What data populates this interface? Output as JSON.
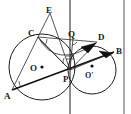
{
  "figure": {
    "width": 131,
    "height": 114,
    "background_color": "#ffffff",
    "ink_color": "#1c1c1c"
  },
  "labels": {
    "A": "A",
    "B": "B",
    "C": "C",
    "D": "D",
    "E": "E",
    "P": "P",
    "Q": "Q",
    "O": "O",
    "O_prime": "O'"
  },
  "points": [
    {
      "id": "A",
      "label": "A",
      "x": 12,
      "y": 90,
      "label_x": 6,
      "label_y": 98
    },
    {
      "id": "B",
      "label": "B",
      "x": 114,
      "y": 52,
      "label_x": 116,
      "label_y": 51
    },
    {
      "id": "C",
      "label": "C",
      "x": 38,
      "y": 37,
      "label_x": 30,
      "label_y": 35
    },
    {
      "id": "D",
      "label": "D",
      "x": 97,
      "y": 42,
      "label_x": 99,
      "label_y": 39
    },
    {
      "id": "E",
      "label": "E",
      "x": 50,
      "y": 13,
      "label_x": 46,
      "label_y": 11
    },
    {
      "id": "P",
      "label": "P",
      "x": 70,
      "y": 70,
      "label_x": 64,
      "label_y": 80
    },
    {
      "id": "Q",
      "label": "Q",
      "x": 73,
      "y": 38,
      "label_x": 70,
      "label_y": 36
    },
    {
      "id": "O",
      "label": "O",
      "x": 42,
      "y": 67,
      "label_x": 31,
      "label_y": 71
    },
    {
      "id": "Oprime",
      "label": "O'",
      "x": 92,
      "y": 70,
      "label_x": 86,
      "label_y": 78
    }
  ],
  "circles": [
    {
      "id": "circle-O",
      "center_label": "O",
      "cx": 42,
      "cy": 67,
      "r": 33
    },
    {
      "id": "circle-Oprime",
      "center_label": "O'",
      "cx": 92,
      "cy": 70,
      "r": 24
    }
  ],
  "segments": [
    {
      "id": "seg-AB",
      "from": "A",
      "to": "B"
    },
    {
      "id": "seg-AC",
      "from": "A",
      "to": "C"
    },
    {
      "id": "seg-CP",
      "from": "C",
      "to": "P"
    },
    {
      "id": "seg-CE",
      "from": "C",
      "to": "E"
    },
    {
      "id": "seg-EP",
      "from": "E",
      "to": "P"
    },
    {
      "id": "seg-CD",
      "from": "C",
      "to": "D"
    },
    {
      "id": "seg-PD",
      "from": "P",
      "to": "D"
    },
    {
      "id": "seg-PB",
      "from": "P",
      "to": "B"
    },
    {
      "id": "seg-PQ",
      "from": "P",
      "to": "Q"
    }
  ],
  "tangent_line": {
    "id": "common-tangent",
    "label": "vertical common tangent through P",
    "x": 70,
    "y_top": 0,
    "y_bottom": 114
  },
  "border": {
    "id": "right-border",
    "x": 124,
    "y_top": 0,
    "y_bottom": 114
  },
  "angle_marks": [
    {
      "id": "angle-at-A",
      "vertex": "A",
      "type": "arc"
    },
    {
      "id": "angle-at-C",
      "vertex": "C",
      "type": "arc"
    },
    {
      "id": "angle-at-Q",
      "vertex": "Q",
      "type": "arc"
    },
    {
      "id": "angle-at-P",
      "vertex": "P",
      "type": "tick"
    },
    {
      "id": "angle-at-D",
      "vertex": "D",
      "type": "filled-wedge"
    },
    {
      "id": "angle-at-B",
      "vertex": "B",
      "type": "filled-wedge"
    }
  ]
}
